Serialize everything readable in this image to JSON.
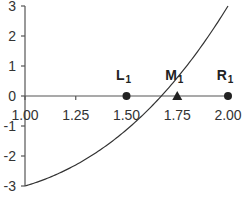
{
  "chart_data": {
    "type": "line",
    "title": "",
    "xlabel": "",
    "ylabel": "",
    "xlim": [
      1.0,
      2.0
    ],
    "ylim": [
      -3,
      3
    ],
    "grid": false,
    "x_ticks": [
      "1.00",
      "1.25",
      "1.50",
      "1.75",
      "2.00"
    ],
    "y_ticks": [
      "3",
      "2",
      "1",
      "0",
      "-1",
      "-2",
      "-3"
    ],
    "series": [
      {
        "name": "f(x)",
        "x": [
          1.0,
          1.1,
          1.2,
          1.3,
          1.4,
          1.5,
          1.6,
          1.7,
          1.8,
          1.9,
          2.0
        ],
        "values": [
          -3.0,
          -2.77,
          -2.47,
          -2.1,
          -1.66,
          -1.13,
          -0.5,
          0.21,
          1.03,
          1.96,
          3.0
        ]
      }
    ],
    "markers": [
      {
        "label": "L",
        "subscript": "1",
        "x": 1.5,
        "y": 0,
        "shape": "circle"
      },
      {
        "label": "M",
        "subscript": "1",
        "x": 1.75,
        "y": 0,
        "shape": "triangle"
      },
      {
        "label": "R",
        "subscript": "1",
        "x": 2.0,
        "y": 0,
        "shape": "circle"
      }
    ],
    "legend": null
  }
}
